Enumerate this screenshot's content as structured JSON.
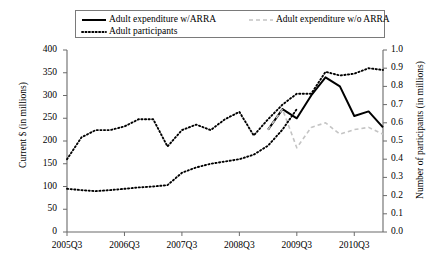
{
  "chart_data": {
    "type": "line",
    "title": "",
    "xlabel": "",
    "ylabel": "Current $ (in millions)",
    "ylabel_right": "Number of participants (in millions)",
    "grid": false,
    "legend_position": "top",
    "x": [
      "2005Q3",
      "2005Q4",
      "2006Q1",
      "2006Q2",
      "2006Q3",
      "2006Q4",
      "2007Q1",
      "2007Q2",
      "2007Q3",
      "2007Q4",
      "2008Q1",
      "2008Q2",
      "2008Q3",
      "2008Q4",
      "2009Q1",
      "2009Q2",
      "2009Q3",
      "2009Q4",
      "2010Q1",
      "2010Q2",
      "2010Q3",
      "2010Q4",
      "2011Q1"
    ],
    "xtick_labels": [
      "2005Q3",
      "2006Q3",
      "2007Q3",
      "2008Q3",
      "2009Q3",
      "2010Q3"
    ],
    "xtick_positions": [
      "2005Q3",
      "2006Q3",
      "2007Q3",
      "2008Q3",
      "2009Q3",
      "2010Q3"
    ],
    "ylim": [
      0,
      400
    ],
    "ytick_labels": [
      "0",
      "50",
      "100",
      "150",
      "200",
      "250",
      "300",
      "350",
      "400"
    ],
    "ylim_right": [
      0.0,
      1.0
    ],
    "ytick_labels_right": [
      "0.0",
      "0.1",
      "0.2",
      "0.3",
      "0.4",
      "0.5",
      "0.6",
      "0.7",
      "0.8",
      "0.9",
      "1.0"
    ],
    "series": [
      {
        "name": "Adult expenditure w/ARRA",
        "axis": "left",
        "style": "solid",
        "color": "#000000",
        "values": [
          null,
          null,
          null,
          null,
          null,
          null,
          null,
          null,
          null,
          null,
          null,
          null,
          null,
          null,
          225,
          270,
          250,
          300,
          340,
          320,
          255,
          265,
          230
        ]
      },
      {
        "name": "Adult expenditure w/o ARRA",
        "axis": "left",
        "style": "dashed",
        "color": "#c4c4c4",
        "values": [
          null,
          null,
          null,
          null,
          null,
          null,
          null,
          null,
          null,
          null,
          null,
          null,
          null,
          null,
          225,
          270,
          185,
          230,
          240,
          215,
          225,
          230,
          215
        ]
      },
      {
        "name": "Adult participants",
        "axis": "right",
        "style": "dotted",
        "color": "#000000",
        "values": [
          0.4,
          0.52,
          0.56,
          0.56,
          0.58,
          0.62,
          0.62,
          0.47,
          0.56,
          0.59,
          0.56,
          0.62,
          0.66,
          0.53,
          0.62,
          0.7,
          0.76,
          0.76,
          0.88,
          0.86,
          0.87,
          0.9,
          0.89
        ]
      },
      {
        "name": "Adult expenditure early (dotted)",
        "axis": "left",
        "style": "dotted",
        "color": "#000000",
        "values": [
          95,
          92,
          90,
          92,
          95,
          98,
          100,
          103,
          130,
          142,
          150,
          155,
          160,
          170,
          190,
          225,
          270,
          null,
          null,
          null,
          null,
          null,
          null
        ]
      }
    ]
  },
  "legend": {
    "items": [
      {
        "label": "Adult expenditure w/ARRA",
        "swatch": "solid-line-swatch"
      },
      {
        "label": "Adult expenditure w/o ARRA",
        "swatch": "dashed-line-swatch"
      },
      {
        "label": "Adult participants",
        "swatch": "dotted-line-swatch"
      }
    ]
  },
  "axes": {
    "left_title": "Current $ (in millions)",
    "right_title": "Number of participants (in millions)"
  }
}
